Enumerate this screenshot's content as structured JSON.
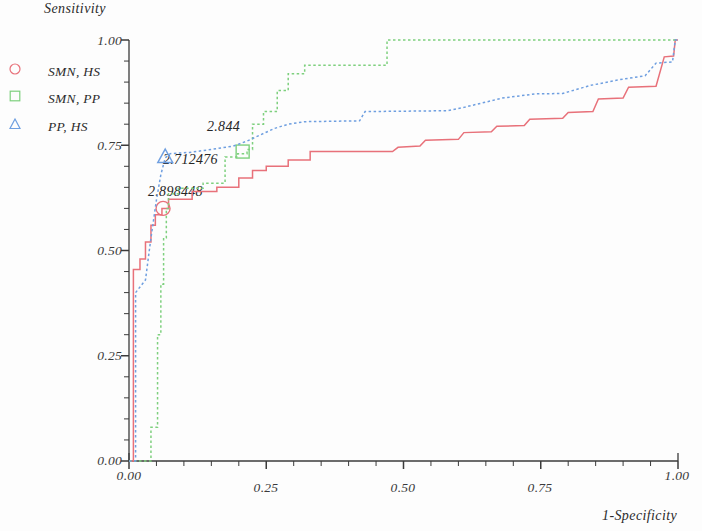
{
  "chart_data": {
    "type": "line",
    "title": "",
    "xlabel": "1-Specificity",
    "ylabel": "Sensitivity",
    "xlim": [
      0,
      1
    ],
    "ylim": [
      0,
      1
    ],
    "grid": false,
    "legend_position": "top-left-outside",
    "xticks": [
      "0.00",
      "0.25",
      "0.50",
      "0.75",
      "1.00"
    ],
    "xtick_values": [
      0,
      0.25,
      0.5,
      0.75,
      1.0
    ],
    "yticks": [
      "0.00",
      "0.25",
      "0.50",
      "0.75",
      "1.00"
    ],
    "ytick_values": [
      0,
      0.25,
      0.5,
      0.75,
      1.0
    ],
    "minor_ticks_per_interval": 5,
    "series": [
      {
        "name": "SMN, HS",
        "color": "#e8717a",
        "marker": "circle",
        "linestyle": "solid",
        "points": [
          [
            0.0,
            0.0
          ],
          [
            0.008,
            0.0
          ],
          [
            0.008,
            0.455
          ],
          [
            0.02,
            0.455
          ],
          [
            0.02,
            0.48
          ],
          [
            0.03,
            0.48
          ],
          [
            0.03,
            0.52
          ],
          [
            0.04,
            0.52
          ],
          [
            0.04,
            0.56
          ],
          [
            0.048,
            0.56
          ],
          [
            0.048,
            0.585
          ],
          [
            0.06,
            0.585
          ],
          [
            0.06,
            0.6
          ],
          [
            0.072,
            0.6
          ],
          [
            0.072,
            0.622
          ],
          [
            0.115,
            0.622
          ],
          [
            0.115,
            0.64
          ],
          [
            0.16,
            0.64
          ],
          [
            0.16,
            0.65
          ],
          [
            0.2,
            0.65
          ],
          [
            0.2,
            0.672
          ],
          [
            0.225,
            0.672
          ],
          [
            0.225,
            0.69
          ],
          [
            0.25,
            0.69
          ],
          [
            0.25,
            0.7
          ],
          [
            0.29,
            0.7
          ],
          [
            0.29,
            0.715
          ],
          [
            0.33,
            0.715
          ],
          [
            0.33,
            0.735
          ],
          [
            0.48,
            0.735
          ],
          [
            0.49,
            0.745
          ],
          [
            0.53,
            0.748
          ],
          [
            0.54,
            0.762
          ],
          [
            0.6,
            0.764
          ],
          [
            0.61,
            0.78
          ],
          [
            0.66,
            0.782
          ],
          [
            0.67,
            0.795
          ],
          [
            0.72,
            0.797
          ],
          [
            0.73,
            0.812
          ],
          [
            0.79,
            0.814
          ],
          [
            0.8,
            0.828
          ],
          [
            0.845,
            0.83
          ],
          [
            0.855,
            0.86
          ],
          [
            0.9,
            0.862
          ],
          [
            0.91,
            0.888
          ],
          [
            0.96,
            0.89
          ],
          [
            0.975,
            0.96
          ],
          [
            0.992,
            0.962
          ],
          [
            0.995,
            1.0
          ],
          [
            1.0,
            1.0
          ]
        ],
        "marker_point": [
          0.062,
          0.6
        ],
        "annotation": "2.898448"
      },
      {
        "name": "SMN, PP",
        "color": "#7ed07e",
        "marker": "square",
        "linestyle": "dotted",
        "points": [
          [
            0.0,
            0.0
          ],
          [
            0.04,
            0.0
          ],
          [
            0.04,
            0.08
          ],
          [
            0.052,
            0.08
          ],
          [
            0.052,
            0.3
          ],
          [
            0.058,
            0.3
          ],
          [
            0.058,
            0.42
          ],
          [
            0.063,
            0.42
          ],
          [
            0.063,
            0.53
          ],
          [
            0.068,
            0.53
          ],
          [
            0.068,
            0.6
          ],
          [
            0.072,
            0.6
          ],
          [
            0.072,
            0.635
          ],
          [
            0.09,
            0.635
          ],
          [
            0.09,
            0.648
          ],
          [
            0.135,
            0.648
          ],
          [
            0.135,
            0.66
          ],
          [
            0.175,
            0.66
          ],
          [
            0.175,
            0.722
          ],
          [
            0.198,
            0.722
          ],
          [
            0.198,
            0.73
          ],
          [
            0.215,
            0.73
          ],
          [
            0.215,
            0.74
          ],
          [
            0.225,
            0.74
          ],
          [
            0.225,
            0.8
          ],
          [
            0.245,
            0.8
          ],
          [
            0.245,
            0.83
          ],
          [
            0.27,
            0.83
          ],
          [
            0.27,
            0.88
          ],
          [
            0.29,
            0.88
          ],
          [
            0.29,
            0.92
          ],
          [
            0.32,
            0.92
          ],
          [
            0.32,
            0.94
          ],
          [
            0.47,
            0.94
          ],
          [
            0.47,
            1.0
          ],
          [
            1.0,
            1.0
          ]
        ],
        "marker_point": [
          0.207,
          0.735
        ],
        "annotation": "2.844"
      },
      {
        "name": "PP, HS",
        "color": "#6f9fe0",
        "marker": "triangle",
        "linestyle": "dotted",
        "points": [
          [
            0.0,
            0.0
          ],
          [
            0.012,
            0.0
          ],
          [
            0.012,
            0.4
          ],
          [
            0.03,
            0.43
          ],
          [
            0.04,
            0.53
          ],
          [
            0.05,
            0.62
          ],
          [
            0.058,
            0.68
          ],
          [
            0.066,
            0.72
          ],
          [
            0.075,
            0.73
          ],
          [
            0.11,
            0.733
          ],
          [
            0.15,
            0.74
          ],
          [
            0.19,
            0.748
          ],
          [
            0.215,
            0.76
          ],
          [
            0.24,
            0.775
          ],
          [
            0.265,
            0.79
          ],
          [
            0.29,
            0.8
          ],
          [
            0.32,
            0.806
          ],
          [
            0.42,
            0.808
          ],
          [
            0.43,
            0.83
          ],
          [
            0.58,
            0.832
          ],
          [
            0.61,
            0.84
          ],
          [
            0.68,
            0.862
          ],
          [
            0.74,
            0.872
          ],
          [
            0.79,
            0.873
          ],
          [
            0.84,
            0.892
          ],
          [
            0.89,
            0.905
          ],
          [
            0.94,
            0.915
          ],
          [
            0.96,
            0.945
          ],
          [
            0.99,
            0.948
          ],
          [
            0.995,
            1.0
          ],
          [
            1.0,
            1.0
          ]
        ],
        "marker_point": [
          0.066,
          0.722
        ],
        "annotation": "2.712476"
      }
    ]
  },
  "axes": {
    "y_title": "Sensitivity",
    "x_title": "1-Specificity"
  },
  "legend": {
    "items": [
      {
        "label": "SMN, HS",
        "marker": "circle-marker",
        "color": "#e8717a"
      },
      {
        "label": "SMN, PP",
        "marker": "square-marker",
        "color": "#7ed07e"
      },
      {
        "label": "PP, HS",
        "marker": "triangle-marker",
        "color": "#6f9fe0"
      }
    ]
  },
  "annotations": {
    "green_cutoff": "2.844",
    "blue_cutoff": "2.712476",
    "red_cutoff": "2.898448"
  },
  "ytick_labels": [
    "1.00",
    "0.75",
    "0.50",
    "0.25",
    "0.00"
  ],
  "xtick_labels": [
    "0.00",
    "0.25",
    "0.50",
    "0.75",
    "1.00"
  ]
}
